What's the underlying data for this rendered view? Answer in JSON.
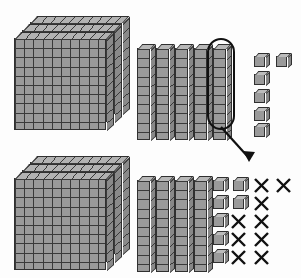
{
  "colors": {
    "background": "#fdfdfd",
    "block_face": "#9a9a9a",
    "block_top": "#b8b8b8",
    "block_side": "#888888",
    "grid_line": "#3a3a3a",
    "outline": "#303030",
    "highlight": "#111111",
    "cross_out": "#111111"
  },
  "legend": {
    "flat_name": "flat",
    "flat_value": 100,
    "rod_name": "rod",
    "rod_value": 10,
    "cube_name": "unit cube",
    "cube_value": 1
  },
  "rows": [
    {
      "id": "top-row",
      "role": "minuend-before-regrouping",
      "flats": 3,
      "rods": 5,
      "cubes": 6,
      "highlighted_rod_index": 5,
      "value": 356
    },
    {
      "id": "bottom-row",
      "role": "after-regrouping-with-subtraction",
      "flats": 3,
      "rods": 4,
      "cubes_total": 16,
      "cubes_remaining": 5,
      "cubes_crossed_out": 11,
      "value": 346
    }
  ],
  "bottom_cube_grid": {
    "columns": 4,
    "rows": 5,
    "cells": [
      [
        "cube",
        "cube",
        "cross",
        "cross"
      ],
      [
        "cube",
        "cube",
        "cross",
        "empty"
      ],
      [
        "cube",
        "cross",
        "cross",
        "empty"
      ],
      [
        "cube",
        "cross",
        "cross",
        "empty"
      ],
      [
        "cube",
        "cross",
        "cross",
        "empty"
      ]
    ]
  },
  "top_cube_layout": {
    "cells": [
      [
        "cube",
        "cube"
      ],
      [
        "cube",
        "empty"
      ],
      [
        "cube",
        "empty"
      ],
      [
        "cube",
        "empty"
      ],
      [
        "cube",
        "empty"
      ]
    ]
  },
  "annotation": {
    "arrow_label": "",
    "meaning": "one ten regrouped into ten ones"
  }
}
